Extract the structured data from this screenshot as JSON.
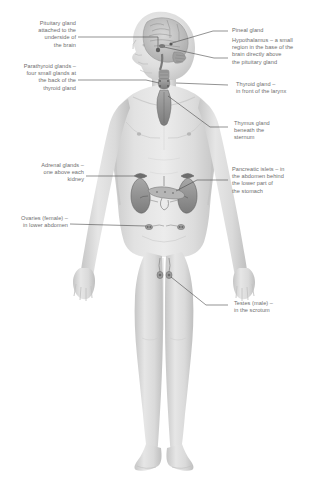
{
  "diagram": {
    "view": "anterior full body with left-facing head profile showing brain",
    "background_color": "#ffffff",
    "text_color": "#6e6e6e",
    "leader_line_color": "#4a4a4a",
    "body_fill": "#dcdcdc",
    "body_shade": "#c2c2c2",
    "organ_fill": "#9a9a9a",
    "organ_dark": "#707070"
  },
  "labels": {
    "pituitary": {
      "text": "Pituitary gland\nattached to the\nunderside of\nthe brain",
      "side": "left"
    },
    "parathyroid": {
      "text": "Parathyroid glands –\nfour small glands at\nthe back of the\nthyroid gland",
      "side": "left"
    },
    "adrenal": {
      "text": "Adrenal glands –\none above each\nkidney",
      "side": "left"
    },
    "ovaries": {
      "text": "Ovaries (female) –\nin lower abdomen",
      "side": "left"
    },
    "pineal": {
      "text": "Pineal gland",
      "side": "right"
    },
    "hypothalamus": {
      "text": "Hypothalamus – a small\nregion in the base of the\nbrain directly above\nthe pituitary gland",
      "side": "right"
    },
    "thyroid": {
      "text": "Thyroid gland –\nin front of the larynx",
      "side": "right"
    },
    "thymus": {
      "text": "Thymus gland\nbeneath the\nsternum",
      "side": "right"
    },
    "pancreatic_islets": {
      "text": "Pancreatic islets – in\nthe abdomen behind\nthe lower part of\nthe stomach",
      "side": "right"
    },
    "testes": {
      "text": "Testes (male) –\nin the scrotum",
      "side": "right"
    }
  }
}
